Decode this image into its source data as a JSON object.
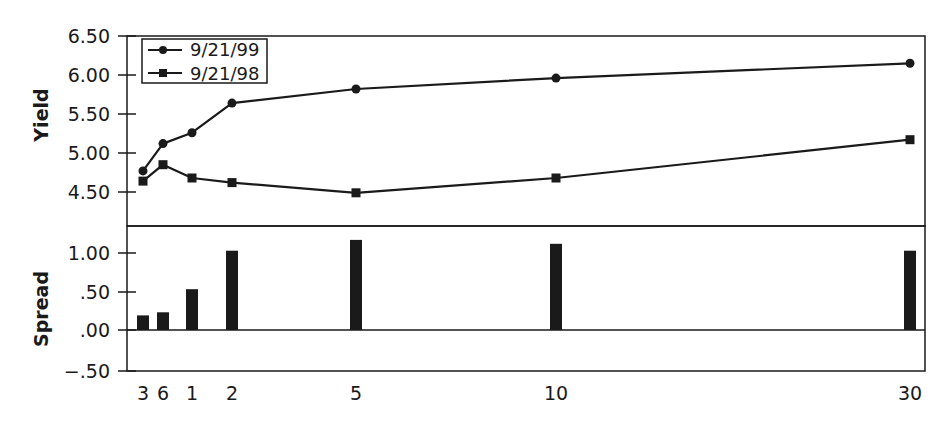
{
  "chart_data": [
    {
      "type": "line",
      "panel": "top",
      "title": "",
      "xlabel": "",
      "ylabel": "Yield",
      "ylim": [
        4.2,
        6.5
      ],
      "yticks": [
        "6.50",
        "6.00",
        "5.50",
        "5.00",
        "4.50"
      ],
      "categories": [
        "3",
        "6",
        "1",
        "2",
        "5",
        "10",
        "30"
      ],
      "category_meaning": [
        "3-month",
        "6-month",
        "1-year",
        "2-year",
        "5-year",
        "10-year",
        "30-year"
      ],
      "series": [
        {
          "name": "9/21/99",
          "marker": "circle",
          "values": [
            4.77,
            5.12,
            5.26,
            5.64,
            5.82,
            5.96,
            6.15
          ]
        },
        {
          "name": "9/21/98",
          "marker": "square",
          "values": [
            4.64,
            4.85,
            4.68,
            4.62,
            4.49,
            4.68,
            5.17
          ]
        }
      ],
      "legend": {
        "position": "upper-left",
        "entries": [
          "9/21/99",
          "9/21/98"
        ]
      },
      "grid": false
    },
    {
      "type": "bar",
      "panel": "bottom",
      "title": "",
      "xlabel": "",
      "ylabel": "Spread",
      "ylim": [
        -0.5,
        1.35
      ],
      "yticks": [
        "1.00",
        ".50",
        ".00",
        "-.50"
      ],
      "categories": [
        "3",
        "6",
        "1",
        "2",
        "5",
        "10",
        "30"
      ],
      "values": [
        0.19,
        0.23,
        0.53,
        1.03,
        1.17,
        1.12,
        1.03
      ],
      "grid": false
    }
  ],
  "chart": {
    "top": {
      "ylabel": "Yield",
      "yticks": [
        {
          "label": "6.50",
          "y": 36
        },
        {
          "label": "6.00",
          "y": 75
        },
        {
          "label": "5.50",
          "y": 114
        },
        {
          "label": "5.00",
          "y": 153
        },
        {
          "label": "4.50",
          "y": 192
        }
      ],
      "legend": [
        {
          "label": "9/21/99",
          "marker": "circle"
        },
        {
          "label": "9/21/98",
          "marker": "square"
        }
      ]
    },
    "bottom": {
      "ylabel": "Spread",
      "yticks": [
        {
          "label": "1.00",
          "y": 253
        },
        {
          "label": ".50",
          "y": 292
        },
        {
          "label": ".00",
          "y": 330
        },
        {
          "label": "−.50",
          "y": 371
        }
      ]
    },
    "xticks": [
      {
        "label": "3",
        "x": 143
      },
      {
        "label": "6",
        "x": 163
      },
      {
        "label": "1",
        "x": 192
      },
      {
        "label": "2",
        "x": 232
      },
      {
        "label": "5",
        "x": 356
      },
      {
        "label": "10",
        "x": 556
      },
      {
        "label": "30",
        "x": 910
      }
    ],
    "colors": {
      "ink": "#1a1a1a",
      "background": "#ffffff"
    }
  }
}
